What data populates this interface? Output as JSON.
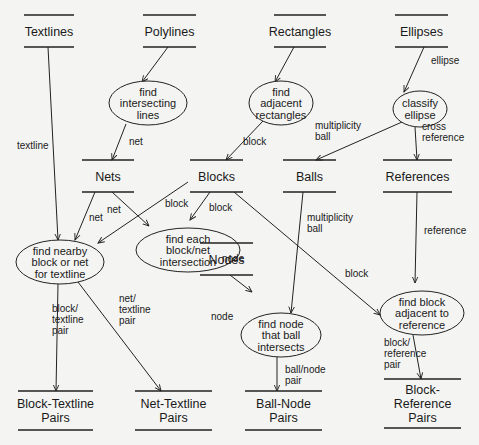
{
  "diagram": {
    "type": "data-flow",
    "colors": {
      "background": "#f4f4f2",
      "ink": "#222222"
    },
    "stores": [
      {
        "id": "textlines",
        "lines": [
          "Textlines"
        ],
        "x1": 24,
        "x2": 74,
        "y_top": 15,
        "y_bot": 47
      },
      {
        "id": "polylines",
        "lines": [
          "Polylines"
        ],
        "x1": 143,
        "x2": 196,
        "y_top": 15,
        "y_bot": 47
      },
      {
        "id": "rectangles",
        "lines": [
          "Rectangles"
        ],
        "x1": 274,
        "x2": 326,
        "y_top": 15,
        "y_bot": 47
      },
      {
        "id": "ellipses",
        "lines": [
          "Ellipses"
        ],
        "x1": 395,
        "x2": 448,
        "y_top": 15,
        "y_bot": 47
      },
      {
        "id": "nets",
        "lines": [
          "Nets"
        ],
        "x1": 82,
        "x2": 134,
        "y_top": 160,
        "y_bot": 192
      },
      {
        "id": "blocks",
        "lines": [
          "Blocks"
        ],
        "x1": 190,
        "x2": 243,
        "y_top": 160,
        "y_bot": 192
      },
      {
        "id": "balls",
        "lines": [
          "Balls"
        ],
        "x1": 283,
        "x2": 336,
        "y_top": 160,
        "y_bot": 192
      },
      {
        "id": "references",
        "lines": [
          "References"
        ],
        "x1": 383,
        "x2": 452,
        "y_top": 160,
        "y_bot": 192
      },
      {
        "id": "nodes",
        "lines": [
          "Nodes"
        ],
        "x1": 200,
        "x2": 253,
        "y_top": 243,
        "y_bot": 275
      },
      {
        "id": "block-textline-pairs",
        "lines": [
          "Block-Textline",
          "Pairs"
        ],
        "x1": 18,
        "x2": 93,
        "y_top": 391,
        "y_bot": 430
      },
      {
        "id": "net-textline-pairs",
        "lines": [
          "Net-Textline",
          "Pairs"
        ],
        "x1": 135,
        "x2": 212,
        "y_top": 391,
        "y_bot": 430
      },
      {
        "id": "ball-node-pairs",
        "lines": [
          "Ball-Node",
          "Pairs"
        ],
        "x1": 245,
        "x2": 322,
        "y_top": 391,
        "y_bot": 430
      },
      {
        "id": "block-reference-pairs",
        "lines": [
          "Block-",
          "Reference",
          "Pairs"
        ],
        "x1": 384,
        "x2": 461,
        "y_top": 379,
        "y_bot": 428
      }
    ],
    "processes": [
      {
        "id": "find-intersecting-lines",
        "lines": [
          "find",
          "intersecting",
          "lines"
        ],
        "cx": 148,
        "cy": 103,
        "rx": 39,
        "ry": 22
      },
      {
        "id": "find-adjacent-rectangles",
        "lines": [
          "find",
          "adjacent",
          "rectangles"
        ],
        "cx": 281,
        "cy": 103,
        "rx": 32,
        "ry": 22
      },
      {
        "id": "classify-ellipse",
        "lines": [
          "classify",
          "ellipse"
        ],
        "cx": 420,
        "cy": 109,
        "rx": 27,
        "ry": 18
      },
      {
        "id": "find-nearby-block-or-net",
        "lines": [
          "find nearby",
          "block or net",
          "for textline"
        ],
        "cx": 60,
        "cy": 262,
        "rx": 44,
        "ry": 22
      },
      {
        "id": "find-block-net-intersection",
        "lines": [
          "find each",
          "block/net",
          "intersection"
        ],
        "cx": 188,
        "cy": 250,
        "rx": 52,
        "ry": 22
      },
      {
        "id": "find-node-ball-intersects",
        "lines": [
          "find node",
          "that ball",
          "intersects"
        ],
        "cx": 281,
        "cy": 335,
        "rx": 40,
        "ry": 22
      },
      {
        "id": "find-block-adjacent-reference",
        "lines": [
          "find block",
          "adjacent to",
          "reference"
        ],
        "cx": 422,
        "cy": 313,
        "rx": 42,
        "ry": 22
      }
    ],
    "edges": [
      {
        "from": "polylines",
        "to": "find-intersecting-lines",
        "points": [
          [
            168,
            47
          ],
          [
            142,
            82
          ]
        ],
        "label": [],
        "lx": 0,
        "ly": 0
      },
      {
        "from": "rectangles",
        "to": "find-adjacent-rectangles",
        "points": [
          [
            294,
            47
          ],
          [
            275,
            82
          ]
        ],
        "label": [],
        "lx": 0,
        "ly": 0
      },
      {
        "from": "ellipses",
        "to": "classify-ellipse",
        "points": [
          [
            424,
            47
          ],
          [
            404,
            92
          ]
        ],
        "label": [
          "ellipse"
        ],
        "lx": 431,
        "ly": 64
      },
      {
        "from": "textlines",
        "to": "find-nearby-block-or-net",
        "points": [
          [
            48,
            47
          ],
          [
            58,
            240
          ]
        ],
        "label": [
          "textline"
        ],
        "lx": 17,
        "ly": 149
      },
      {
        "from": "find-intersecting-lines",
        "to": "nets",
        "points": [
          [
            126,
            124
          ],
          [
            112,
            160
          ]
        ],
        "label": [
          "net"
        ],
        "lx": 129,
        "ly": 145
      },
      {
        "from": "find-adjacent-rectangles",
        "to": "blocks",
        "points": [
          [
            263,
            121
          ],
          [
            226,
            160
          ]
        ],
        "label": [
          "block"
        ],
        "lx": 243,
        "ly": 145
      },
      {
        "from": "classify-ellipse",
        "to": "balls",
        "points": [
          [
            402,
            122
          ],
          [
            316,
            160
          ]
        ],
        "label": [
          "multiplicity",
          "ball"
        ],
        "lx": 315,
        "ly": 129
      },
      {
        "from": "classify-ellipse",
        "to": "references",
        "points": [
          [
            415,
            127
          ],
          [
            417,
            160
          ]
        ],
        "label": [
          "cross",
          "reference"
        ],
        "lx": 422,
        "ly": 130
      },
      {
        "from": "nets",
        "to": "find-nearby-block-or-net",
        "points": [
          [
            95,
            192
          ],
          [
            75,
            240
          ]
        ],
        "label": [
          "net"
        ],
        "lx": 89,
        "ly": 221
      },
      {
        "from": "nets",
        "to": "find-block-net-intersection",
        "points": [
          [
            112,
            192
          ],
          [
            149,
            226
          ]
        ],
        "label": [
          "net"
        ],
        "lx": 107,
        "ly": 213
      },
      {
        "from": "blocks",
        "to": "find-nearby-block-or-net",
        "points": [
          [
            188,
            182
          ],
          [
            98,
            243
          ]
        ],
        "label": [
          "block"
        ],
        "lx": 165,
        "ly": 207
      },
      {
        "from": "blocks",
        "to": "find-block-net-intersection",
        "points": [
          [
            210,
            192
          ],
          [
            190,
            220
          ]
        ],
        "label": [
          "block"
        ],
        "lx": 209,
        "ly": 211
      },
      {
        "from": "blocks",
        "to": "find-block-adjacent-reference",
        "points": [
          [
            234,
            192
          ],
          [
            380,
            315
          ]
        ],
        "label": [
          "block"
        ],
        "lx": 345,
        "ly": 277
      },
      {
        "from": "find-block-net-intersection",
        "to": "nodes",
        "points": [
          [
            210,
            270
          ],
          [
            215,
            243
          ]
        ],
        "label": [
          "node"
        ],
        "lx": 222,
        "ly": 262
      },
      {
        "from": "nodes",
        "to": "find-node-ball-intersects",
        "points": [
          [
            230,
            275
          ],
          [
            252,
            292
          ]
        ],
        "label": [
          "node"
        ],
        "lx": 211,
        "ly": 320
      },
      {
        "from": "balls",
        "to": "find-node-ball-intersects",
        "points": [
          [
            303,
            192
          ],
          [
            291,
            313
          ]
        ],
        "label": [
          "multiplicity",
          "ball"
        ],
        "lx": 307,
        "ly": 221
      },
      {
        "from": "references",
        "to": "find-block-adjacent-reference",
        "points": [
          [
            417,
            192
          ],
          [
            415,
            283
          ]
        ],
        "label": [
          "reference"
        ],
        "lx": 424,
        "ly": 234
      },
      {
        "from": "find-nearby-block-or-net",
        "to": "block-textline-pairs",
        "points": [
          [
            58,
            284
          ],
          [
            56,
            391
          ]
        ],
        "label": [
          "block/",
          "textline",
          "pair"
        ],
        "lx": 52,
        "ly": 312
      },
      {
        "from": "find-nearby-block-or-net",
        "to": "net-textline-pairs",
        "points": [
          [
            78,
            282
          ],
          [
            161,
            391
          ]
        ],
        "label": [
          "net/",
          "textline",
          "pair"
        ],
        "lx": 119,
        "ly": 302
      },
      {
        "from": "find-node-ball-intersects",
        "to": "ball-node-pairs",
        "points": [
          [
            277,
            357
          ],
          [
            277,
            391
          ]
        ],
        "label": [
          "ball/node",
          "pair"
        ],
        "lx": 285,
        "ly": 373
      },
      {
        "from": "find-block-adjacent-reference",
        "to": "block-reference-pairs",
        "points": [
          [
            413,
            335
          ],
          [
            421,
            379
          ]
        ],
        "label": [
          "block/",
          "reference",
          "pair"
        ],
        "lx": 384,
        "ly": 346
      }
    ]
  }
}
